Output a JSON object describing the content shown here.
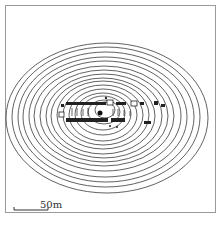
{
  "map": {
    "type": "contour-site-plan",
    "scale_bar": {
      "label": "50m",
      "length_px": 34
    },
    "contours": {
      "count": 16,
      "center": [
        106,
        118
      ],
      "outer_radius": [
        101,
        75
      ],
      "inner_radius": [
        10,
        8
      ]
    },
    "features": {
      "row_upper_y": 104,
      "row_lower_y": 120,
      "central_dot": [
        100,
        113
      ]
    },
    "colors": {
      "line": "#333333",
      "frame": "#9a9a9a"
    }
  },
  "caption": {
    "left": "",
    "right": ""
  }
}
